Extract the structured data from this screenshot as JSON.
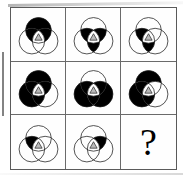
{
  "puzzle": {
    "type": "ravens-progressive-matrix",
    "title": "Three overlapping circles matrix puzzle",
    "rows": 3,
    "columns": 3,
    "missing_cell_index": 8,
    "missing_cell_label": "?",
    "colors": {
      "fill": "#000000",
      "stroke": "#1a1a1a",
      "background": "#ffffff",
      "grid_line": "#6a6a6a",
      "outer_border": "#5a5a5a"
    },
    "geometry": {
      "circle_radius": 15.5,
      "circle_top": {
        "cx": 27,
        "cy": 21
      },
      "circle_bottom_left": {
        "cx": 19,
        "cy": 34
      },
      "circle_bottom_right": {
        "cx": 35,
        "cy": 34
      },
      "viewbox": "0 0 54 52"
    },
    "region_names": [
      "top-only",
      "bottom-left-only",
      "bottom-right-only",
      "top-and-bottom-left",
      "top-and-bottom-right",
      "bottom-left-and-bottom-right",
      "center-all-three"
    ],
    "cells": [
      {
        "index": 0,
        "name": "cell-row1-col1",
        "description": "Top circle filled black, center triangle light",
        "filled": [
          "top-only",
          "top-and-bottom-left",
          "top-and-bottom-right"
        ],
        "center_filled": false
      },
      {
        "index": 1,
        "name": "cell-row1-col2",
        "description": "Both lower lens regions and lower band filled black",
        "filled": [
          "top-and-bottom-left",
          "top-and-bottom-right",
          "bottom-left-and-bottom-right"
        ],
        "center_filled": false
      },
      {
        "index": 2,
        "name": "cell-row1-col3",
        "description": "Left lens and lower-left band filled black",
        "filled": [
          "top-and-bottom-left",
          "bottom-left-and-bottom-right"
        ],
        "center_filled": false
      },
      {
        "index": 3,
        "name": "cell-row2-col1",
        "description": "Top circle and bottom-left circle fully black",
        "filled": [
          "top-only",
          "bottom-left-only",
          "top-and-bottom-left",
          "top-and-bottom-right",
          "bottom-left-and-bottom-right"
        ],
        "center_filled": false
      },
      {
        "index": 4,
        "name": "cell-row2-col2",
        "description": "Both bottom circles fully black, top circle outlined",
        "filled": [
          "bottom-left-only",
          "bottom-right-only",
          "top-and-bottom-left",
          "top-and-bottom-right",
          "bottom-left-and-bottom-right"
        ],
        "center_filled": false
      },
      {
        "index": 5,
        "name": "cell-row2-col3",
        "description": "Top circle and bottom-left circle black, bottom-right outlined",
        "filled": [
          "top-only",
          "bottom-left-only",
          "top-and-bottom-left",
          "bottom-left-and-bottom-right"
        ],
        "center_filled": false
      },
      {
        "index": 6,
        "name": "cell-row3-col1",
        "description": "Only the left lens region filled black",
        "filled": [
          "top-and-bottom-left"
        ],
        "center_filled": false
      },
      {
        "index": 7,
        "name": "cell-row3-col2",
        "description": "Only the right lens region filled black",
        "filled": [
          "top-and-bottom-right"
        ],
        "center_filled": false
      },
      {
        "index": 8,
        "name": "cell-row3-col3-answer",
        "description": "Unknown answer cell showing a question mark",
        "filled": [],
        "center_filled": false,
        "is_question": true
      }
    ]
  }
}
